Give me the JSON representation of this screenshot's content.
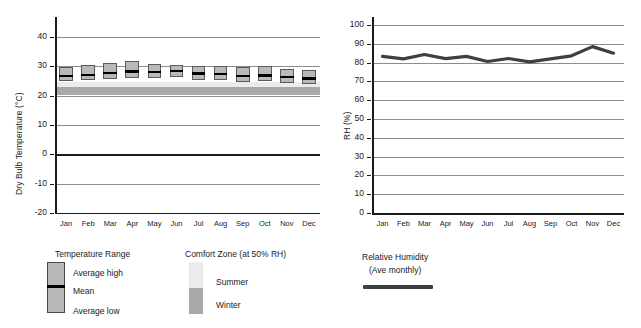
{
  "chart_data": [
    {
      "type": "bar",
      "chart_id": "dry-bulb-temperature",
      "title": "",
      "xlabel": "",
      "ylabel": "Dry Bulb Temperature (°C)",
      "categories": [
        "Jan",
        "Feb",
        "Mar",
        "Apr",
        "May",
        "Jun",
        "Jul",
        "Aug",
        "Sep",
        "Oct",
        "Nov",
        "Dec"
      ],
      "ylim": [
        -20,
        44
      ],
      "yticks": [
        40,
        30,
        20,
        10,
        0,
        -10,
        -20
      ],
      "ytick_labels": [
        "40",
        "30",
        "20",
        "10",
        "0",
        "-10",
        "-20"
      ],
      "grid": true,
      "legend_position": "below",
      "series": [
        {
          "name": "Average high",
          "values": [
            29.8,
            30.3,
            31.0,
            31.6,
            30.7,
            30.5,
            30.1,
            30.2,
            29.7,
            30.0,
            29.0,
            28.7
          ]
        },
        {
          "name": "Mean",
          "values": [
            26.8,
            27.1,
            27.8,
            28.2,
            28.1,
            28.5,
            27.5,
            27.4,
            26.8,
            27.0,
            26.4,
            25.8
          ]
        },
        {
          "name": "Average low",
          "values": [
            24.8,
            25.2,
            25.6,
            25.8,
            25.8,
            26.3,
            25.4,
            25.3,
            24.5,
            24.8,
            24.3,
            23.8
          ]
        }
      ],
      "bands": [
        {
          "name": "Summer comfort zone (at 50% RH)",
          "ymin": 22.8,
          "ymax": 24.5,
          "color": "#ebebeb"
        },
        {
          "name": "Winter comfort zone (at 50% RH)",
          "ymin": 20.0,
          "ymax": 22.8,
          "color": "#a8a8a8"
        }
      ]
    },
    {
      "type": "line",
      "chart_id": "relative-humidity",
      "title": "",
      "xlabel": "",
      "ylabel": "RH (%)",
      "categories": [
        "Jan",
        "Feb",
        "Mar",
        "Apr",
        "May",
        "Jun",
        "Jul",
        "Aug",
        "Sep",
        "Oct",
        "Nov",
        "Dec"
      ],
      "ylim": [
        0,
        100
      ],
      "yticks": [
        100,
        90,
        80,
        70,
        60,
        50,
        40,
        30,
        20,
        10,
        0
      ],
      "ytick_labels": [
        "100",
        "90",
        "80",
        "70",
        "60",
        "50",
        "40",
        "30",
        "20",
        "10",
        "0"
      ],
      "grid": true,
      "legend_position": "below",
      "series": [
        {
          "name": "Relative Humidity (Ave monthly)",
          "values": [
            83.3,
            82.0,
            84.3,
            82.1,
            83.3,
            80.6,
            82.2,
            80.4,
            82.0,
            83.6,
            88.5,
            85.0
          ],
          "color": "#3f3f3f"
        }
      ]
    }
  ],
  "left_chart": {
    "ylabel": "Dry Bulb Temperature (°C)",
    "ytick_labels": [
      "40",
      "30",
      "20",
      "10",
      "0",
      "-10",
      "-20"
    ],
    "xtick_labels": [
      "Jan",
      "Feb",
      "Mar",
      "Apr",
      "May",
      "Jun",
      "Jul",
      "Aug",
      "Sep",
      "Oct",
      "Nov",
      "Dec"
    ]
  },
  "right_chart": {
    "ylabel": "RH (%)",
    "ytick_labels": [
      "100",
      "90",
      "80",
      "70",
      "60",
      "50",
      "40",
      "30",
      "20",
      "10",
      "0"
    ],
    "xtick_labels": [
      "Jan",
      "Feb",
      "Mar",
      "Apr",
      "May",
      "Jun",
      "Jul",
      "Aug",
      "Sep",
      "Oct",
      "Nov",
      "Dec"
    ]
  },
  "legend_temperature": {
    "title": "Temperature Range",
    "items": [
      "Average high",
      "Mean",
      "Average low"
    ]
  },
  "legend_comfort": {
    "title": "Comfort Zone (at 50% RH)",
    "items": [
      "Summer",
      "Winter"
    ]
  },
  "legend_humidity": {
    "title_line1": "Relative Humidity",
    "title_line2": "(Ave monthly)"
  },
  "colors": {
    "bar_fill": "#b9b9b9",
    "bar_stroke": "#5a5a5a",
    "mean_line": "#000000",
    "summer_band": "#ebebeb",
    "winter_band": "#a8a8a8",
    "rh_line": "#3f3f3f",
    "grid": "#8c8c8c",
    "axis": "#1a1a1a"
  }
}
